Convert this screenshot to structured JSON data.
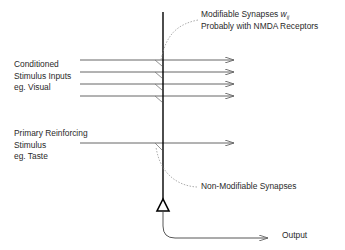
{
  "diagram": {
    "title": "",
    "labels": {
      "modifiable": {
        "line1_prefix": "Modifiable Synapses ",
        "line1_symbol": "w",
        "line1_subscript": "ij",
        "line2": "Probably with NMDA Receptors"
      },
      "conditioned": {
        "line1": "Conditioned",
        "line2": "Stimulus Inputs",
        "line3": "eg. Visual"
      },
      "primary": {
        "line1": "Primary Reinforcing",
        "line2": "Stimulus",
        "line3": "eg. Taste"
      },
      "non_modifiable": "Non-Modifiable Synapses",
      "output": "Output"
    },
    "colors": {
      "neuron_line": "#000000",
      "input_lines": "#555555",
      "dashed": "#888888",
      "text": "#2a2a2a"
    }
  }
}
